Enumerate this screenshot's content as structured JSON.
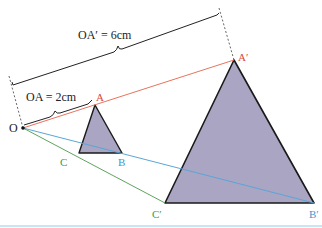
{
  "diagram": {
    "type": "enlargement",
    "center": {
      "label": "O",
      "x": 23,
      "y": 128
    },
    "small_triangle": {
      "vertices": {
        "A": {
          "label": "A",
          "x": 95,
          "y": 105
        },
        "B": {
          "label": "B",
          "x": 122,
          "y": 153
        },
        "C": {
          "label": "C",
          "x": 79,
          "y": 153
        }
      },
      "fill": "#a9a5c2"
    },
    "large_triangle": {
      "vertices": {
        "A": {
          "label": "A′",
          "x": 234,
          "y": 60
        },
        "B": {
          "label": "B′",
          "x": 314,
          "y": 203
        },
        "C": {
          "label": "C′",
          "x": 165,
          "y": 203
        }
      },
      "fill": "#a9a5c2"
    },
    "measurements": {
      "oa": "OA = 2cm",
      "oa_prime": "OA′ = 6cm"
    },
    "colors": {
      "ray_a": "#e8735e",
      "ray_b": "#5aa6d6",
      "ray_c": "#5fa35f",
      "label_a": "#d9493a",
      "label_b": "#3d97cf",
      "label_c": "#3f9a45",
      "outline": "#1a1a1a",
      "bottom_rule": "#c9e6f4"
    }
  }
}
